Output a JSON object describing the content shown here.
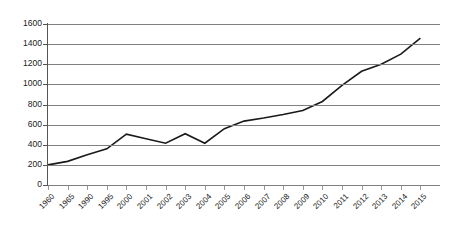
{
  "chart_data": {
    "type": "line",
    "title": "",
    "subtitle": "",
    "xlabel": "",
    "ylabel": "",
    "categories": [
      "1960",
      "1965",
      "1990",
      "1995",
      "2000",
      "2001",
      "2002",
      "2003",
      "2004",
      "2005",
      "2006",
      "2007",
      "2008",
      "2009",
      "2010",
      "2011",
      "2012",
      "2013",
      "2014",
      "2015"
    ],
    "values": [
      200,
      235,
      300,
      360,
      505,
      460,
      415,
      510,
      415,
      560,
      635,
      665,
      700,
      740,
      830,
      990,
      1130,
      1200,
      1300,
      1460
    ],
    "series": [
      {
        "name": "",
        "values": [
          200,
          235,
          300,
          360,
          505,
          460,
          415,
          510,
          415,
          560,
          635,
          665,
          700,
          740,
          830,
          990,
          1130,
          1200,
          1300,
          1460
        ]
      }
    ],
    "ylim": [
      0,
      1600
    ],
    "ytick_step": 200,
    "yticks": [
      0,
      200,
      400,
      600,
      800,
      1000,
      1200,
      1400,
      1600
    ],
    "ytick_labels": [
      "0",
      "200",
      "400",
      "600",
      "800",
      "1000",
      "1200",
      "1400",
      "1600"
    ],
    "grid": true,
    "grid_axis": "y",
    "legend": false,
    "legend_position": "none",
    "annotations": [],
    "line_color": "#1a1a1a",
    "grid_color": "#808080",
    "background_color": "#ffffff",
    "xtick_label_rotation": -45
  }
}
